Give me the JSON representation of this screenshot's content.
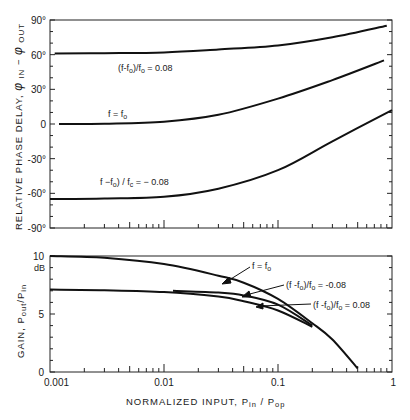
{
  "chart_data": [
    {
      "type": "line",
      "title": "",
      "xscale": "log",
      "xlim": [
        0.001,
        1
      ],
      "ylim": [
        -90,
        90
      ],
      "ylabel": "RELATIVE PHASE DELAY, φ IN − φ OUT",
      "ytick_labels": [
        "90°",
        "60°",
        "30°",
        "0",
        "-30°",
        "-60°",
        "-90°"
      ],
      "yticks": [
        90,
        60,
        30,
        0,
        -30,
        -60,
        -90
      ],
      "grid": false,
      "series": [
        {
          "name": "(f-fo)/fo = 0.08",
          "x": [
            0.0011,
            0.003,
            0.01,
            0.03,
            0.1,
            0.3,
            0.9
          ],
          "y": [
            61,
            61.3,
            62,
            64.5,
            68,
            75,
            85
          ]
        },
        {
          "name": "f = fo",
          "x": [
            0.0012,
            0.003,
            0.01,
            0.03,
            0.1,
            0.3,
            0.85
          ],
          "y": [
            0,
            0.3,
            2,
            8,
            22,
            38,
            55
          ]
        },
        {
          "name": "(f-fo)/fo = -0.08",
          "x": [
            0.001,
            0.003,
            0.01,
            0.03,
            0.1,
            0.3,
            1.0
          ],
          "y": [
            -65,
            -64.5,
            -63,
            -56,
            -40,
            -15,
            12
          ]
        }
      ]
    },
    {
      "type": "line",
      "title": "",
      "xscale": "log",
      "xlabel": "NORMALIZED INPUT, Pin / Pop",
      "ylabel": "GAIN, Pout/Pin",
      "yunit": "dB",
      "xlim": [
        0.001,
        1
      ],
      "ylim": [
        0,
        10
      ],
      "xtick_labels": [
        "0.001",
        "0.01",
        "0.1",
        "1"
      ],
      "ytick_labels": [
        "10",
        "5",
        "0"
      ],
      "grid": false,
      "series": [
        {
          "name": "f = fo",
          "x": [
            0.001,
            0.003,
            0.01,
            0.03,
            0.05,
            0.1,
            0.2,
            0.3,
            0.5
          ],
          "y": [
            10,
            9.85,
            9.3,
            8.3,
            7.7,
            6.3,
            4.2,
            2.8,
            0.3
          ]
        },
        {
          "name": "(f-fo)/fo = -0.08",
          "x": [
            0.012,
            0.03,
            0.05,
            0.1,
            0.2
          ],
          "y": [
            7.0,
            6.85,
            6.6,
            5.8,
            4.0
          ]
        },
        {
          "name": "(f-fo)/fo = 0.08",
          "x": [
            0.001,
            0.003,
            0.01,
            0.03,
            0.05,
            0.1,
            0.2
          ],
          "y": [
            7.1,
            7.05,
            6.9,
            6.5,
            6.1,
            5.3,
            3.9
          ]
        }
      ]
    }
  ],
  "upper": {
    "ylabel_main": "RELATIVE  PHASE  DELAY, ",
    "ylabel_phi": "φ",
    "ylabel_in": " IN",
    "ylabel_minus": " − ",
    "ylabel_out": " OUT",
    "yticks": [
      "90°",
      "60°",
      "30°",
      "0",
      "-30°",
      "-60°",
      "-90°"
    ],
    "labels": {
      "plus": "(f-f",
      "plus_sub": "o",
      "plus_mid": ")/f",
      "plus_sub2": "o",
      "plus_tail": " = 0.08",
      "center": "f = f",
      "center_sub": "o",
      "minus": "f  −f",
      "minus_sub": "o",
      "minus_mid": ")  /  f",
      "minus_sub2": "c",
      "minus_tail": " = − 0.08"
    }
  },
  "lower": {
    "ylabel": "GAIN,  P",
    "ylabel_out": "out",
    "ylabel_slash": "/P",
    "ylabel_in": "in",
    "unit": "dB",
    "yticks": [
      "10",
      "5",
      "0"
    ],
    "xticks": [
      "0.001",
      "0.01",
      "0.1",
      "1"
    ],
    "xlabel": "NORMALIZED  INPUT,    P",
    "xlabel_in": "in",
    "xlabel_slash": "  /  P",
    "xlabel_op": "op",
    "labels": {
      "center": "f = f",
      "center_sub": "o",
      "minus": "(f -f",
      "minus_sub": "o",
      "minus_mid": ")/f",
      "minus_sub2": "o",
      "minus_tail": " = -0.08",
      "plus": "(f -f",
      "plus_sub": "o",
      "plus_mid": ")/f",
      "plus_sub2": "o",
      "plus_tail": " = 0.08"
    }
  }
}
